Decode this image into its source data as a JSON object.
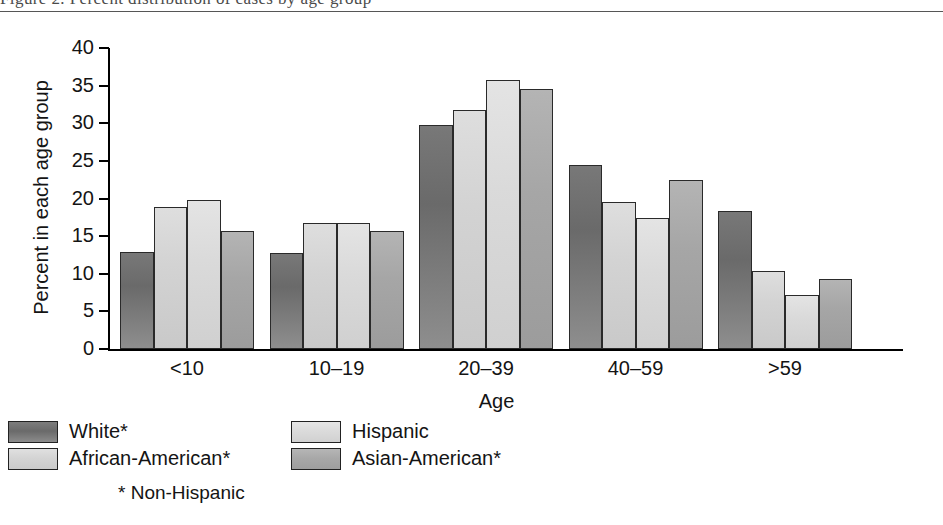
{
  "caption": {
    "text": "Figure 2. Percent distribution of cases by age group",
    "divider_visible": true
  },
  "chart_data": {
    "type": "bar",
    "title": "",
    "xlabel": "Age",
    "ylabel": "Percent in each age group",
    "categories": [
      "<10",
      "10–19",
      "20–39",
      "40–59",
      ">59"
    ],
    "series": [
      {
        "name": "White*",
        "color": "#6a6a6a",
        "values": [
          12.9,
          12.7,
          29.8,
          24.5,
          18.3
        ]
      },
      {
        "name": "African-American*",
        "color": "#d4d4d4",
        "values": [
          18.9,
          16.8,
          31.7,
          19.5,
          10.4
        ]
      },
      {
        "name": "Hispanic",
        "color": "#dbdbdb",
        "values": [
          19.8,
          16.7,
          35.7,
          17.4,
          7.2
        ]
      },
      {
        "name": "Asian-American*",
        "color": "#a8a8a8",
        "values": [
          15.7,
          15.7,
          34.6,
          22.4,
          9.3
        ]
      }
    ],
    "ylim": [
      0,
      40
    ],
    "yticks": [
      0,
      5,
      10,
      15,
      20,
      25,
      30,
      35,
      40
    ],
    "ytick_labels": [
      "0",
      "5",
      "10",
      "15",
      "20",
      "25",
      "30",
      "35",
      "40"
    ],
    "grid": false,
    "legend_position": "below",
    "legend_note": "* Non-Hispanic"
  }
}
